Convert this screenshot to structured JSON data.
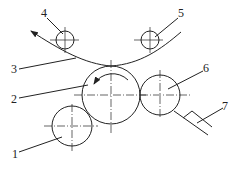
{
  "diagram": {
    "type": "roller-mechanism-schematic",
    "labels": {
      "l1": "1",
      "l2": "2",
      "l3": "3",
      "l4": "4",
      "l5": "5",
      "l6": "6",
      "l7": "7"
    },
    "components": [
      {
        "id": "1",
        "shape": "circle",
        "cx": 72,
        "cy": 126,
        "r": 20
      },
      {
        "id": "2",
        "shape": "circle",
        "cx": 111,
        "cy": 95,
        "r": 29,
        "rotation": "counter-clockwise"
      },
      {
        "id": "3",
        "shape": "curve",
        "description": "web/strip passing over roller 2 between rollers 4 and 5"
      },
      {
        "id": "4",
        "shape": "circle",
        "cx": 65,
        "cy": 40,
        "r": 9
      },
      {
        "id": "5",
        "shape": "circle",
        "cx": 150,
        "cy": 40,
        "r": 9
      },
      {
        "id": "6",
        "shape": "circle",
        "cx": 160,
        "cy": 95,
        "r": 20
      },
      {
        "id": "7",
        "shape": "blade",
        "description": "scraper blade against roller 6"
      }
    ],
    "colors": {
      "stroke": "#222222",
      "background": "#ffffff"
    }
  }
}
